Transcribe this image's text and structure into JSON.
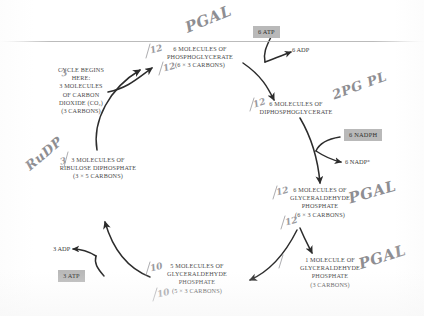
{
  "diagram": {
    "ink_color": "#4a4a4a",
    "chip_color": "#b9b9b9",
    "handwriting_color": "#8e8e92"
  },
  "nodes": {
    "start_note": "CYCLE BEGINS\nHERE:\n3 MOLECULES\nOF CARBON\nDIOXIDE (CO₂)\n(3 CARBONS)",
    "phosphoglycerate": "6 MOLECULES OF\nPHOSPHOGLYCERATE\n(6 × 3 CARBONS)",
    "diphosphoglycerate": "6 MOLECULES OF\nDIPHOSPHOGLYCERATE",
    "glyceraldehyde_six": "6 MOLECULES OF\nGLYCERALDEHYDE\nPHOSPHATE\n(6 × 3 CARBONS)",
    "glyceraldehyde_one": "1 MOLECULE OF\nGLYCERALDEHYDE\nPHOSPHATE\n(3 CARBONS)",
    "glyceraldehyde_five": "5 MOLECULES OF\nGLYCERALDEHYDE\nPHOSPHATE\n(5 × 3 CARBONS)",
    "ribulose_diphosphate": "3 MOLECULES OF\nRIBULOSE DIPHOSPHATE\n(3 × 5 CARBONS)"
  },
  "cofactors": {
    "atp_six": "6 ATP",
    "adp_six": "6 ADP",
    "nadph_six": "6 NADPH",
    "nadp_six": "6 NADP⁺",
    "adp_three": "3 ADP",
    "atp_three": "3 ATP"
  },
  "annotations": {
    "pgal_top": "PGAL",
    "twelve_top": "12",
    "twelve_diphospho": "12",
    "pgpl_right": "2PG PL",
    "pgal_mid_right": "PGAL",
    "twelve_mid_right": "12",
    "pgal_bottom_right": "PGAL",
    "rudp_left": "RuDP",
    "three_rudp": "3",
    "ten_bottom": "10",
    "ten_bottom_2": "10"
  }
}
